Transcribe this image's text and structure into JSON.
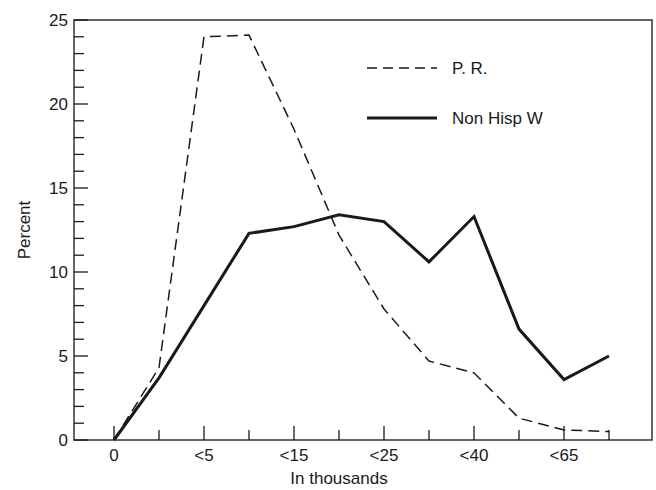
{
  "chart_data": {
    "type": "line",
    "title": "",
    "xlabel": "In thousands",
    "ylabel": "Percent",
    "ylim": [
      0,
      25
    ],
    "yticks": [
      0,
      5,
      10,
      15,
      20,
      25
    ],
    "x_tick_labels": [
      "0",
      "",
      "<5",
      "",
      "<15",
      "",
      "<25",
      "",
      "<40",
      "",
      "<65",
      ""
    ],
    "x_labeled_ticks": [
      "0",
      "<5",
      "<15",
      "<25",
      "<40",
      "<65"
    ],
    "grid": false,
    "legend_position": "upper right",
    "x": [
      0,
      1,
      2,
      3,
      4,
      5,
      6,
      7,
      8,
      9,
      10,
      11
    ],
    "series": [
      {
        "name": "P. R.",
        "style": "dashed",
        "values": [
          0,
          4.3,
          24.0,
          24.1,
          18.5,
          12.2,
          7.8,
          4.7,
          4.0,
          1.3,
          0.6,
          0.5
        ]
      },
      {
        "name": "Non Hisp W",
        "style": "solid",
        "values": [
          0,
          3.7,
          8.0,
          12.3,
          12.7,
          13.4,
          13.0,
          10.6,
          13.3,
          6.6,
          3.6,
          5.0
        ]
      }
    ]
  },
  "colors": {
    "ink": "#1a1a1a",
    "background": "#ffffff"
  }
}
